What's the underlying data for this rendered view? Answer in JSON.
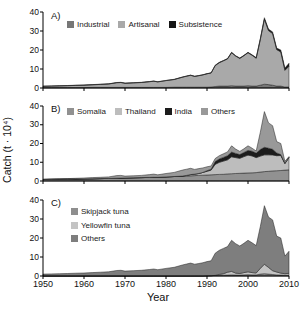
{
  "figure": {
    "y_axis_title": "Catch (t · 10⁴)",
    "x_axis_title": "Year",
    "y_tick_values": [
      0,
      10,
      20,
      30,
      40
    ],
    "x_tick_values": [
      1950,
      1960,
      1970,
      1980,
      1990,
      2000,
      2010
    ],
    "background_color": "#ffffff",
    "axis_color": "#000000"
  },
  "chart_data": [
    {
      "type": "area",
      "stacked": true,
      "panel_label": "A)",
      "legend_position": "top-horizontal",
      "xlim": [
        1950,
        2010
      ],
      "ylim": [
        0,
        40
      ],
      "x": [
        1950,
        1952,
        1954,
        1956,
        1958,
        1960,
        1962,
        1964,
        1966,
        1968,
        1969,
        1970,
        1972,
        1974,
        1976,
        1977,
        1978,
        1980,
        1982,
        1984,
        1985,
        1986,
        1987,
        1988,
        1989,
        1990,
        1991,
        1992,
        1993,
        1994,
        1995,
        1996,
        1997,
        1998,
        1999,
        2000,
        2001,
        2002,
        2003,
        2004,
        2005,
        2006,
        2007,
        2008,
        2009,
        2010
      ],
      "series": [
        {
          "name": "Industrial",
          "color": "#777777",
          "values": [
            0.2,
            0.2,
            0.2,
            0.2,
            0.2,
            0.2,
            0.3,
            0.3,
            0.3,
            0.3,
            0.3,
            0.3,
            0.3,
            0.3,
            0.3,
            0.3,
            0.3,
            0.3,
            0.4,
            0.4,
            0.4,
            0.4,
            0.4,
            0.4,
            0.4,
            0.4,
            0.5,
            0.8,
            1.0,
            1.0,
            1.0,
            1.2,
            1.0,
            1.0,
            1.0,
            1.2,
            1.0,
            1.0,
            1.5,
            2.0,
            1.8,
            1.5,
            1.0,
            1.0,
            0.5,
            0.5
          ]
        },
        {
          "name": "Artisanal",
          "color": "#a9a9a9",
          "values": [
            0.7,
            0.8,
            0.9,
            1.0,
            1.15,
            1.3,
            1.4,
            1.6,
            1.8,
            2.5,
            2.6,
            2.2,
            2.4,
            2.6,
            3.0,
            3.3,
            2.9,
            3.6,
            4.1,
            5.3,
            5.8,
            6.3,
            5.7,
            6.1,
            6.5,
            7.1,
            7.4,
            11.0,
            12.3,
            13.3,
            14.3,
            17.4,
            15.8,
            14.6,
            16.0,
            17.4,
            16.2,
            14.7,
            24.0,
            34.2,
            28.4,
            27.2,
            19.2,
            18.0,
            8.8,
            11.0
          ]
        },
        {
          "name": "Subsistence",
          "color": "#161616",
          "values": [
            0.1,
            0.1,
            0.1,
            0.1,
            0.1,
            0.1,
            0.1,
            0.1,
            0.1,
            0.1,
            0.1,
            0.1,
            0.1,
            0.1,
            0.1,
            0.1,
            0.1,
            0.1,
            0.1,
            0.1,
            0.1,
            0.1,
            0.1,
            0.1,
            0.1,
            0.1,
            0.1,
            0.2,
            0.2,
            0.2,
            0.2,
            0.2,
            0.2,
            0.2,
            0.2,
            0.2,
            0.3,
            0.3,
            0.5,
            0.8,
            0.8,
            0.8,
            0.8,
            1.0,
            1.2,
            1.5
          ]
        }
      ]
    },
    {
      "type": "area",
      "stacked": true,
      "panel_label": "B)",
      "legend_position": "top-horizontal",
      "xlim": [
        1950,
        2010
      ],
      "ylim": [
        0,
        40
      ],
      "x": [
        1950,
        1952,
        1954,
        1956,
        1958,
        1960,
        1962,
        1964,
        1966,
        1968,
        1969,
        1970,
        1972,
        1974,
        1976,
        1977,
        1978,
        1980,
        1982,
        1984,
        1985,
        1986,
        1987,
        1988,
        1989,
        1990,
        1991,
        1992,
        1993,
        1994,
        1995,
        1996,
        1997,
        1998,
        1999,
        2000,
        2001,
        2002,
        2003,
        2004,
        2005,
        2006,
        2007,
        2008,
        2009,
        2010
      ],
      "series": [
        {
          "name": "Somalia",
          "color": "#919191",
          "values": [
            0.8,
            0.85,
            0.9,
            0.95,
            1.0,
            1.1,
            1.2,
            1.3,
            1.4,
            1.5,
            1.55,
            1.6,
            1.7,
            1.8,
            1.9,
            2.0,
            2.0,
            2.2,
            2.4,
            2.6,
            2.7,
            2.8,
            2.9,
            3.0,
            3.1,
            3.2,
            3.3,
            3.4,
            3.5,
            3.6,
            3.8,
            3.9,
            4.0,
            4.1,
            4.2,
            4.3,
            4.4,
            4.5,
            4.8,
            5.0,
            5.2,
            5.4,
            5.5,
            5.6,
            5.8,
            6.0
          ]
        },
        {
          "name": "Thailand",
          "color": "#bdbdbd",
          "values": [
            0,
            0,
            0,
            0,
            0,
            0,
            0,
            0,
            0,
            0,
            0,
            0,
            0,
            0,
            0,
            0,
            0,
            0,
            0,
            0,
            0.3,
            0.6,
            0.8,
            1.0,
            1.5,
            2.0,
            2.5,
            5.5,
            6.5,
            7.0,
            7.5,
            9.0,
            8.5,
            8.0,
            8.8,
            9.5,
            9.0,
            8.0,
            8.5,
            9.0,
            8.8,
            8.5,
            8.0,
            8.0,
            3.5,
            6.5
          ]
        },
        {
          "name": "India",
          "color": "#1c1c1c",
          "values": [
            0,
            0,
            0,
            0,
            0,
            0,
            0,
            0,
            0,
            0,
            0,
            0,
            0,
            0,
            0,
            0,
            0,
            0,
            0,
            0,
            0,
            0,
            0,
            0,
            0,
            0.3,
            0.5,
            1.5,
            1.8,
            2.0,
            2.2,
            2.5,
            2.2,
            2.0,
            2.2,
            2.5,
            2.5,
            2.4,
            3.5,
            4.0,
            3.5,
            3.0,
            1.5,
            0.5,
            0.2,
            0.1
          ]
        },
        {
          "name": "Others",
          "color": "#999999",
          "values": [
            0.2,
            0.25,
            0.3,
            0.35,
            0.45,
            0.5,
            0.6,
            0.7,
            0.8,
            1.4,
            1.45,
            1.0,
            1.1,
            1.2,
            1.5,
            1.7,
            1.3,
            1.8,
            2.2,
            3.2,
            3.3,
            3.4,
            2.5,
            2.6,
            2.4,
            2.1,
            1.7,
            1.6,
            1.7,
            1.9,
            2.0,
            3.4,
            2.3,
            1.7,
            2.0,
            2.5,
            1.6,
            1.1,
            9.2,
            19.0,
            13.5,
            12.6,
            6.0,
            5.9,
            1.0,
            0.4
          ]
        }
      ]
    },
    {
      "type": "area",
      "stacked": true,
      "panel_label": "C)",
      "legend_position": "top-left-vertical",
      "xlim": [
        1950,
        2010
      ],
      "ylim": [
        0,
        40
      ],
      "x": [
        1950,
        1952,
        1954,
        1956,
        1958,
        1960,
        1962,
        1964,
        1966,
        1968,
        1969,
        1970,
        1972,
        1974,
        1976,
        1977,
        1978,
        1980,
        1982,
        1984,
        1985,
        1986,
        1987,
        1988,
        1989,
        1990,
        1991,
        1992,
        1993,
        1994,
        1995,
        1996,
        1997,
        1998,
        1999,
        2000,
        2001,
        2002,
        2003,
        2004,
        2005,
        2006,
        2007,
        2008,
        2009,
        2010
      ],
      "series": [
        {
          "name": "Skipjack tuna",
          "color": "#8e8e8e",
          "values": [
            0,
            0,
            0,
            0,
            0,
            0,
            0,
            0,
            0,
            0,
            0,
            0,
            0,
            0,
            0,
            0,
            0,
            0,
            0,
            0,
            0,
            0,
            0,
            0,
            0,
            0.1,
            0.15,
            0.3,
            0.35,
            0.4,
            0.5,
            0.6,
            0.5,
            0.5,
            0.6,
            0.7,
            0.6,
            0.6,
            1.0,
            1.2,
            1.0,
            0.8,
            0.6,
            0.5,
            0.4,
            0.4
          ]
        },
        {
          "name": "Yellowfin tuna",
          "color": "#c4c4c4",
          "values": [
            0,
            0,
            0,
            0,
            0,
            0,
            0,
            0,
            0,
            0,
            0,
            0,
            0,
            0,
            0,
            0,
            0,
            0,
            0,
            0,
            0,
            0,
            0,
            0,
            0,
            0,
            0,
            0,
            0.5,
            0.8,
            1.5,
            1.8,
            1.0,
            0.8,
            1.2,
            1.5,
            1.2,
            1.0,
            3.0,
            5.0,
            3.5,
            2.0,
            1.5,
            1.0,
            0.8,
            1.0
          ]
        },
        {
          "name": "Others",
          "color": "#7e7e7e",
          "values": [
            1.0,
            1.1,
            1.2,
            1.3,
            1.45,
            1.6,
            1.8,
            2.0,
            2.2,
            2.9,
            3.0,
            2.6,
            2.8,
            3.0,
            3.4,
            3.7,
            3.3,
            4.0,
            4.6,
            5.8,
            6.3,
            6.8,
            6.2,
            6.6,
            7.0,
            7.5,
            7.85,
            11.7,
            12.65,
            13.3,
            13.5,
            16.4,
            15.5,
            14.5,
            15.4,
            16.6,
            15.7,
            14.4,
            22.0,
            30.8,
            26.5,
            26.7,
            18.9,
            18.5,
            9.3,
            11.6
          ]
        }
      ]
    }
  ]
}
